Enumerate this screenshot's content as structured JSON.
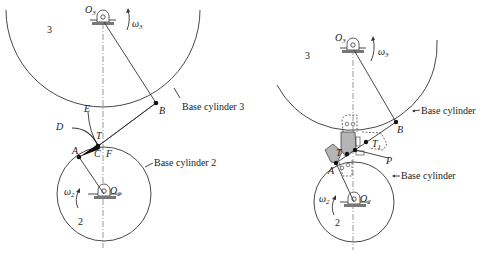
{
  "left_figure": {
    "gear3_label": "3",
    "gear2_label": "2",
    "O3": {
      "main": "O",
      "sub": "3"
    },
    "O2": {
      "main": "O",
      "sub": "2"
    },
    "omega3": {
      "main": "ω",
      "sub": "3"
    },
    "omega2": {
      "main": "ω",
      "sub": "2"
    },
    "points": {
      "A": "A",
      "B": "B",
      "C": "C",
      "D": "D",
      "E": "E",
      "F": "F",
      "T": "T"
    },
    "base_cylinder_3": "Base cylinder 3",
    "base_cylinder_2": "Base cylinder 2"
  },
  "right_figure": {
    "gear3_label": "3",
    "gear2_label": "2",
    "O3": {
      "main": "O",
      "sub": "3"
    },
    "O2": {
      "main": "O",
      "sub": "2"
    },
    "omega3": {
      "main": "ω",
      "sub": "3"
    },
    "omega2": {
      "main": "ω",
      "sub": "2"
    },
    "points": {
      "A": "A",
      "B": "B",
      "T": "T",
      "T1": "T",
      "T1_sub": "1",
      "P": "P"
    },
    "base_cylinder_upper": "Base cylinder",
    "base_cylinder_lower": "Base cylinder"
  },
  "colors": {
    "line": "#333333",
    "shade": "#b5b5b5",
    "ground": "#777777"
  }
}
